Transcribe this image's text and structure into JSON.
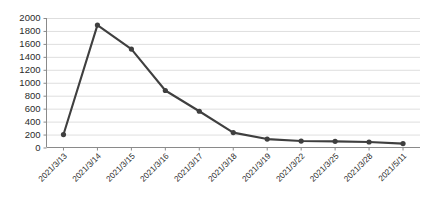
{
  "chart_data": {
    "type": "line",
    "title": "",
    "subtitle": "",
    "xlabel": "",
    "ylabel": "",
    "categories": [
      "2021/3/13",
      "2021/3/14",
      "2021/3/15",
      "2021/3/16",
      "2021/3/17",
      "2021/3/18",
      "2021/3/19",
      "2021/3/22",
      "2021/3/25",
      "2021/3/28",
      "2021/5/11"
    ],
    "values": [
      200,
      1890,
      1520,
      880,
      560,
      230,
      130,
      100,
      95,
      85,
      60
    ],
    "ylim": [
      0,
      2000
    ],
    "yticks": [
      0,
      200,
      400,
      600,
      800,
      1000,
      1200,
      1400,
      1600,
      1800,
      2000
    ],
    "ytick_labels": [
      "0",
      "200",
      "400",
      "600",
      "800",
      "1000",
      "1200",
      "1400",
      "1600",
      "1800",
      "2000"
    ],
    "grid": true,
    "grid_axis": "y",
    "legend": false,
    "legend_position": "none",
    "series": [
      {
        "name": "",
        "values": [
          200,
          1890,
          1520,
          880,
          560,
          230,
          130,
          100,
          95,
          85,
          60
        ],
        "color": "#3f3f3f",
        "marker": "circle"
      }
    ],
    "colors": {
      "line": "#3f3f3f",
      "marker": "#3f3f3f",
      "grid": "#d6d6d6",
      "axis": "#8a8a8a",
      "text": "#2b2b2b",
      "background": "#ffffff"
    }
  }
}
